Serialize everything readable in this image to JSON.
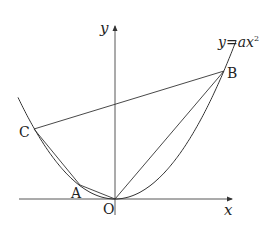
{
  "diagram": {
    "type": "coordinate-geometry",
    "axes": {
      "x_label": "x",
      "y_label": "y",
      "origin_label": "O"
    },
    "curve": {
      "equation_label_y": "y",
      "equation_label_eq": "=",
      "equation_label_rhs_a": "a",
      "equation_label_rhs_x": "x",
      "equation_label_exp": "2"
    },
    "points": {
      "A": {
        "label": "A"
      },
      "B": {
        "label": "B"
      },
      "C": {
        "label": "C"
      }
    },
    "segments": [
      "CB",
      "CA",
      "AO",
      "OB"
    ],
    "colors": {
      "line": "#333333",
      "background": "#ffffff"
    }
  }
}
